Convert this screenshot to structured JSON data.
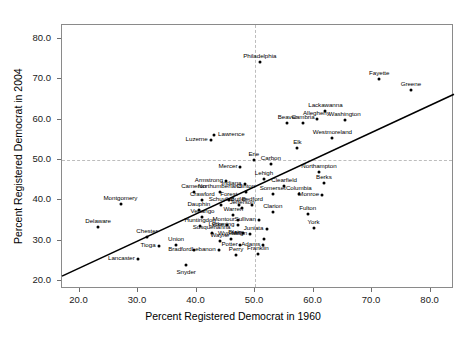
{
  "chart_data": {
    "type": "scatter",
    "title": "",
    "xlabel": "Percent Registered Democrat in 1960",
    "ylabel": "Percent Registered Democrat in 2004",
    "xlim": [
      17.0,
      84.0
    ],
    "ylim": [
      18.0,
      83.5
    ],
    "xticks": [
      "20.0",
      "30.0",
      "40.0",
      "50.0",
      "60.0",
      "70.0",
      "80.0"
    ],
    "xtick_values": [
      20,
      30,
      40,
      50,
      60,
      70,
      80
    ],
    "yticks": [
      "20.0",
      "30.0",
      "40.0",
      "50.0",
      "60.0",
      "70.0",
      "80.0"
    ],
    "ytick_values": [
      20,
      30,
      40,
      50,
      60,
      70,
      80
    ],
    "grid": false,
    "legend": "none",
    "reference_lines": [
      {
        "orientation": "vertical",
        "value": 50,
        "style": "dashed",
        "color": "#bdbdbd"
      },
      {
        "orientation": "horizontal",
        "value": 50,
        "style": "dashed",
        "color": "#bdbdbd"
      }
    ],
    "fit_line": {
      "type": "linear-regression",
      "color": "#000000",
      "x_start": 17.0,
      "y_start": 21.2,
      "x_end": 84.0,
      "y_end": 66.3
    },
    "point_labels": true,
    "points": [
      {
        "label": "Philadelphia",
        "x": 50.8,
        "y": 74.2,
        "label_pos": "above"
      },
      {
        "label": "Fayette",
        "x": 71.2,
        "y": 70.2,
        "label_pos": "above"
      },
      {
        "label": "Greene",
        "x": 76.6,
        "y": 67.3,
        "label_pos": "above"
      },
      {
        "label": "Lackawanna",
        "x": 62.0,
        "y": 62.1,
        "label_pos": "above"
      },
      {
        "label": "Allegheny",
        "x": 60.5,
        "y": 60.3,
        "label_pos": "above"
      },
      {
        "label": "Washington",
        "x": 65.3,
        "y": 60.0,
        "label_pos": "above"
      },
      {
        "label": "Beaver",
        "x": 55.5,
        "y": 59.3,
        "label_pos": "above"
      },
      {
        "label": "Cambria",
        "x": 58.2,
        "y": 59.2,
        "label_pos": "above"
      },
      {
        "label": "Westmoreland",
        "x": 63.2,
        "y": 55.4,
        "label_pos": "above"
      },
      {
        "label": "Lawrence",
        "x": 43.0,
        "y": 56.2,
        "label_pos": "right"
      },
      {
        "label": "Luzerne",
        "x": 42.4,
        "y": 55.0,
        "label_pos": "left"
      },
      {
        "label": "Elk",
        "x": 57.2,
        "y": 53.1,
        "label_pos": "above"
      },
      {
        "label": "Erie",
        "x": 49.8,
        "y": 49.9,
        "label_pos": "above"
      },
      {
        "label": "Carbon",
        "x": 52.7,
        "y": 49.0,
        "label_pos": "above"
      },
      {
        "label": "Mercer",
        "x": 47.5,
        "y": 48.3,
        "label_pos": "left"
      },
      {
        "label": "Northampton",
        "x": 60.9,
        "y": 47.0,
        "label_pos": "above"
      },
      {
        "label": "Lehigh",
        "x": 51.5,
        "y": 45.2,
        "label_pos": "above"
      },
      {
        "label": "Berks",
        "x": 61.8,
        "y": 44.3,
        "label_pos": "above"
      },
      {
        "label": "Armstrong",
        "x": 45.0,
        "y": 44.7,
        "label_pos": "left"
      },
      {
        "label": "Indiana",
        "x": 48.2,
        "y": 44.0,
        "label_pos": "left"
      },
      {
        "label": "Clearfield",
        "x": 55.0,
        "y": 43.5,
        "label_pos": "above"
      },
      {
        "label": "Cameron",
        "x": 39.5,
        "y": 42.0,
        "label_pos": "above"
      },
      {
        "label": "Northumberland",
        "x": 44.0,
        "y": 42.0,
        "label_pos": "above"
      },
      {
        "label": "Clinton",
        "x": 48.4,
        "y": 42.0,
        "label_pos": "above"
      },
      {
        "label": "Somerset",
        "x": 53.0,
        "y": 41.5,
        "label_pos": "above"
      },
      {
        "label": "Columbia",
        "x": 57.5,
        "y": 41.5,
        "label_pos": "above"
      },
      {
        "label": "Monroe",
        "x": 61.5,
        "y": 41.2,
        "label_pos": "left"
      },
      {
        "label": "Crawford",
        "x": 41.0,
        "y": 40.2,
        "label_pos": "above"
      },
      {
        "label": "Forest",
        "x": 45.5,
        "y": 40.2,
        "label_pos": "above"
      },
      {
        "label": "Montgomery",
        "x": 27.0,
        "y": 39.0,
        "label_pos": "above"
      },
      {
        "label": "Schuylkill",
        "x": 44.2,
        "y": 38.8,
        "label_pos": "above"
      },
      {
        "label": "Butler",
        "x": 47.2,
        "y": 38.8,
        "label_pos": "above"
      },
      {
        "label": "Bedford",
        "x": 49.5,
        "y": 38.8,
        "label_pos": "above"
      },
      {
        "label": "Dauphin",
        "x": 40.4,
        "y": 37.6,
        "label_pos": "above"
      },
      {
        "label": "Jefferson",
        "x": 47.8,
        "y": 38.0,
        "label_pos": "above"
      },
      {
        "label": "Clarion",
        "x": 53.0,
        "y": 37.0,
        "label_pos": "above"
      },
      {
        "label": "Venango",
        "x": 41.0,
        "y": 35.8,
        "label_pos": "above"
      },
      {
        "label": "Warren",
        "x": 46.3,
        "y": 36.3,
        "label_pos": "above"
      },
      {
        "label": "Montour",
        "x": 47.0,
        "y": 35.0,
        "label_pos": "left"
      },
      {
        "label": "Sullivan",
        "x": 50.6,
        "y": 35.2,
        "label_pos": "left"
      },
      {
        "label": "Fulton",
        "x": 59.0,
        "y": 36.5,
        "label_pos": "above"
      },
      {
        "label": "Delaware",
        "x": 23.2,
        "y": 33.3,
        "label_pos": "above"
      },
      {
        "label": "Huntingdon",
        "x": 40.6,
        "y": 33.7,
        "label_pos": "above"
      },
      {
        "label": "Pike",
        "x": 45.2,
        "y": 33.8,
        "label_pos": "left"
      },
      {
        "label": "Lycoming",
        "x": 47.0,
        "y": 33.8,
        "label_pos": "left"
      },
      {
        "label": "Juniata",
        "x": 52.0,
        "y": 33.0,
        "label_pos": "left"
      },
      {
        "label": "York",
        "x": 60.0,
        "y": 33.1,
        "label_pos": "above"
      },
      {
        "label": "Susquehanna",
        "x": 42.6,
        "y": 32.0,
        "label_pos": "above"
      },
      {
        "label": "Mifflin",
        "x": 49.2,
        "y": 31.6,
        "label_pos": "left"
      },
      {
        "label": "Blair",
        "x": 48.0,
        "y": 31.8,
        "label_pos": "left"
      },
      {
        "label": "Chester",
        "x": 31.5,
        "y": 30.8,
        "label_pos": "above"
      },
      {
        "label": "Wyoming",
        "x": 45.8,
        "y": 30.4,
        "label_pos": "above"
      },
      {
        "label": "Wayne",
        "x": 44.0,
        "y": 29.8,
        "label_pos": "above"
      },
      {
        "label": "Bedford2",
        "x": 51.5,
        "y": 30.5,
        "label_pos": "hidden"
      },
      {
        "label": "Potter",
        "x": 47.5,
        "y": 28.8,
        "label_pos": "left"
      },
      {
        "label": "Tioga",
        "x": 33.5,
        "y": 28.6,
        "label_pos": "left"
      },
      {
        "label": "Union",
        "x": 36.5,
        "y": 28.8,
        "label_pos": "above"
      },
      {
        "label": "Adams",
        "x": 51.4,
        "y": 28.9,
        "label_pos": "left"
      },
      {
        "label": "Bradford",
        "x": 39.6,
        "y": 27.7,
        "label_pos": "left"
      },
      {
        "label": "Lebanon",
        "x": 43.8,
        "y": 27.6,
        "label_pos": "left"
      },
      {
        "label": "Franklin",
        "x": 50.5,
        "y": 26.8,
        "label_pos": "above"
      },
      {
        "label": "Perry",
        "x": 46.8,
        "y": 26.4,
        "label_pos": "above"
      },
      {
        "label": "Lancaster",
        "x": 30.0,
        "y": 25.5,
        "label_pos": "left"
      },
      {
        "label": "Snyder",
        "x": 38.2,
        "y": 24.0,
        "label_pos": "below"
      }
    ]
  },
  "axis": {
    "x_title": "Percent Registered Democrat in 1960",
    "y_title": "Percent Registered Democrat in 2004"
  }
}
